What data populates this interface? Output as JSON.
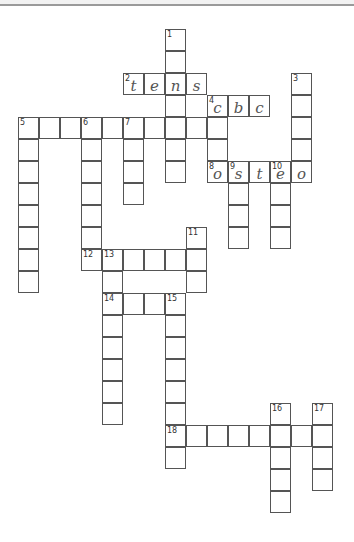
{
  "header": {
    "line_color": "#9a9a9a"
  },
  "grid": {
    "origin_x": 18,
    "origin_y": 29,
    "cell_width": 21,
    "cell_height": 22,
    "border_color": "#555555"
  },
  "words": [
    {
      "number": 1,
      "direction": "down",
      "row": 0,
      "col": 7,
      "length": 7,
      "letters": [
        "",
        "",
        "n",
        "",
        "",
        "",
        ""
      ]
    },
    {
      "number": 2,
      "direction": "across",
      "row": 2,
      "col": 5,
      "length": 4,
      "letters": [
        "t",
        "e",
        "n",
        "s"
      ]
    },
    {
      "number": 3,
      "direction": "down",
      "row": 2,
      "col": 13,
      "length": 5,
      "letters": [
        "",
        "",
        "",
        "",
        "o"
      ]
    },
    {
      "number": 4,
      "direction": "across",
      "row": 3,
      "col": 9,
      "length": 3,
      "letters": [
        "c",
        "b",
        "c"
      ]
    },
    {
      "number": 4,
      "direction": "down",
      "row": 3,
      "col": 9,
      "length": 4,
      "letters": [
        "c",
        "",
        "",
        "o"
      ]
    },
    {
      "number": 5,
      "direction": "across",
      "row": 4,
      "col": 0,
      "length": 10,
      "letters": [
        "",
        "",
        "",
        "",
        "",
        "",
        "",
        "",
        "",
        ""
      ]
    },
    {
      "number": 5,
      "direction": "down",
      "row": 4,
      "col": 0,
      "length": 8,
      "letters": [
        "",
        "",
        "",
        "",
        "",
        "",
        "",
        ""
      ]
    },
    {
      "number": 6,
      "direction": "down",
      "row": 4,
      "col": 3,
      "length": 7,
      "letters": [
        "",
        "",
        "",
        "",
        "",
        "",
        ""
      ]
    },
    {
      "number": 7,
      "direction": "down",
      "row": 4,
      "col": 5,
      "length": 4,
      "letters": [
        "",
        "",
        "",
        ""
      ]
    },
    {
      "number": 8,
      "direction": "across",
      "row": 6,
      "col": 9,
      "length": 5,
      "letters": [
        "o",
        "s",
        "t",
        "e",
        "o"
      ]
    },
    {
      "number": 9,
      "direction": "down",
      "row": 6,
      "col": 10,
      "length": 4,
      "letters": [
        "s",
        "",
        "",
        ""
      ]
    },
    {
      "number": 10,
      "direction": "down",
      "row": 6,
      "col": 12,
      "length": 4,
      "letters": [
        "e",
        "",
        "",
        ""
      ]
    },
    {
      "number": 11,
      "direction": "down",
      "row": 9,
      "col": 8,
      "length": 3,
      "letters": [
        "",
        "",
        ""
      ]
    },
    {
      "number": 12,
      "direction": "across",
      "row": 10,
      "col": 3,
      "length": 6,
      "letters": [
        "",
        "",
        "",
        "",
        "",
        ""
      ]
    },
    {
      "number": 13,
      "direction": "down",
      "row": 10,
      "col": 4,
      "length": 8,
      "letters": [
        "",
        "",
        "",
        "",
        "",
        "",
        "",
        ""
      ]
    },
    {
      "number": 14,
      "direction": "across",
      "row": 12,
      "col": 4,
      "length": 4,
      "letters": [
        "",
        "",
        "",
        ""
      ]
    },
    {
      "number": 15,
      "direction": "down",
      "row": 12,
      "col": 7,
      "length": 8,
      "letters": [
        "",
        "",
        "",
        "",
        "",
        "",
        "",
        ""
      ]
    },
    {
      "number": 16,
      "direction": "down",
      "row": 17,
      "col": 12,
      "length": 5,
      "letters": [
        "",
        "",
        "",
        "",
        ""
      ]
    },
    {
      "number": 17,
      "direction": "down",
      "row": 17,
      "col": 14,
      "length": 4,
      "letters": [
        "",
        "",
        "",
        ""
      ]
    },
    {
      "number": 18,
      "direction": "across",
      "row": 18,
      "col": 7,
      "length": 8,
      "letters": [
        "",
        "",
        "",
        "",
        "",
        "",
        "",
        ""
      ]
    }
  ]
}
